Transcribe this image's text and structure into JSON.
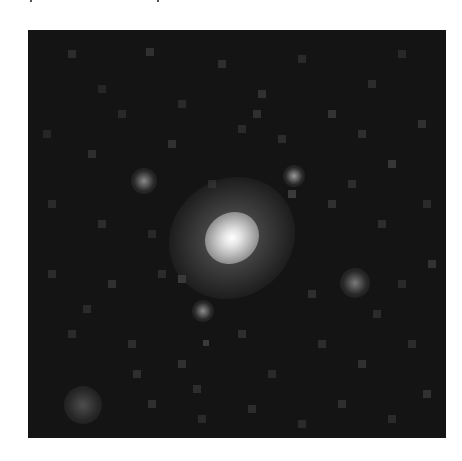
{
  "image": {
    "description": "Grayscale astronomical cutout of a galaxy with nearby faint sources on a noisy dark sky background",
    "frame": {
      "x": 28,
      "y": 30,
      "width": 418,
      "height": 408
    },
    "background_color": "#141414",
    "page_color": "#ffffff",
    "galaxy": {
      "center": {
        "x": 204,
        "y": 208
      },
      "halo": {
        "width": 130,
        "height": 118,
        "rotation_deg": -35
      },
      "core": {
        "width": 56,
        "height": 50,
        "rotation_deg": -35
      }
    },
    "sources": [
      {
        "name": "upper-left-source",
        "x": 103,
        "y": 138,
        "size": 26,
        "brightness": "#8a8a8a"
      },
      {
        "name": "upper-right-source",
        "x": 255,
        "y": 135,
        "size": 22,
        "brightness": "#9a9a9a"
      },
      {
        "name": "right-source",
        "x": 312,
        "y": 238,
        "size": 30,
        "brightness": "#7a7a7a"
      },
      {
        "name": "lower-left-source",
        "x": 36,
        "y": 356,
        "size": 38,
        "brightness": "#4e4e4e"
      },
      {
        "name": "below-galaxy-source",
        "x": 164,
        "y": 270,
        "size": 22,
        "brightness": "#8c8c8c"
      }
    ],
    "noise_blocks": [
      [
        40,
        20,
        8,
        "#2c2c2c"
      ],
      [
        70,
        55,
        8,
        "#262626"
      ],
      [
        118,
        18,
        8,
        "#303030"
      ],
      [
        150,
        70,
        8,
        "#2a2a2a"
      ],
      [
        190,
        30,
        8,
        "#2e2e2e"
      ],
      [
        230,
        60,
        8,
        "#303030"
      ],
      [
        270,
        25,
        8,
        "#2a2a2a"
      ],
      [
        300,
        80,
        8,
        "#333333"
      ],
      [
        340,
        50,
        8,
        "#2c2c2c"
      ],
      [
        370,
        20,
        8,
        "#282828"
      ],
      [
        390,
        90,
        8,
        "#303030"
      ],
      [
        15,
        100,
        8,
        "#262626"
      ],
      [
        60,
        120,
        8,
        "#2e2e2e"
      ],
      [
        140,
        110,
        8,
        "#313131"
      ],
      [
        210,
        95,
        8,
        "#2a2a2a"
      ],
      [
        330,
        100,
        8,
        "#2f2f2f"
      ],
      [
        360,
        130,
        8,
        "#363636"
      ],
      [
        20,
        170,
        8,
        "#2a2a2a"
      ],
      [
        70,
        190,
        8,
        "#2c2c2c"
      ],
      [
        120,
        200,
        8,
        "#282828"
      ],
      [
        300,
        170,
        8,
        "#303030"
      ],
      [
        350,
        190,
        8,
        "#2d2d2d"
      ],
      [
        395,
        170,
        8,
        "#2a2a2a"
      ],
      [
        20,
        240,
        8,
        "#2c2c2c"
      ],
      [
        80,
        250,
        8,
        "#303030"
      ],
      [
        130,
        240,
        8,
        "#2b2b2b"
      ],
      [
        280,
        260,
        8,
        "#2e2e2e"
      ],
      [
        370,
        250,
        8,
        "#2a2a2a"
      ],
      [
        400,
        230,
        8,
        "#323232"
      ],
      [
        40,
        300,
        8,
        "#2b2b2b"
      ],
      [
        100,
        310,
        8,
        "#2d2d2d"
      ],
      [
        150,
        330,
        8,
        "#303030"
      ],
      [
        210,
        300,
        8,
        "#2e2e2e"
      ],
      [
        240,
        340,
        8,
        "#2a2a2a"
      ],
      [
        290,
        310,
        8,
        "#2c2c2c"
      ],
      [
        330,
        330,
        8,
        "#303030"
      ],
      [
        380,
        310,
        8,
        "#2b2b2b"
      ],
      [
        120,
        370,
        8,
        "#2f2f2f"
      ],
      [
        170,
        385,
        8,
        "#2a2a2a"
      ],
      [
        220,
        375,
        8,
        "#2d2d2d"
      ],
      [
        270,
        390,
        8,
        "#2b2b2b"
      ],
      [
        310,
        370,
        8,
        "#2e2e2e"
      ],
      [
        360,
        385,
        8,
        "#2a2a2a"
      ],
      [
        395,
        360,
        8,
        "#303030"
      ],
      [
        90,
        80,
        8,
        "#292929"
      ],
      [
        250,
        105,
        8,
        "#2c2c2c"
      ],
      [
        180,
        150,
        8,
        "#2a2a2a"
      ],
      [
        320,
        150,
        8,
        "#2d2d2d"
      ],
      [
        55,
        275,
        8,
        "#2a2a2a"
      ],
      [
        165,
        355,
        8,
        "#2c2c2c"
      ],
      [
        175,
        310,
        6,
        "#3a3a3a"
      ],
      [
        150,
        245,
        8,
        "#3a3a3a"
      ],
      [
        225,
        80,
        8,
        "#2f2f2f"
      ],
      [
        105,
        340,
        8,
        "#2e2e2e"
      ],
      [
        345,
        280,
        8,
        "#2b2b2b"
      ],
      [
        260,
        160,
        8,
        "#3a3a3a"
      ]
    ],
    "top_artifacts": [
      {
        "x": 30
      },
      {
        "x": 157
      }
    ]
  }
}
